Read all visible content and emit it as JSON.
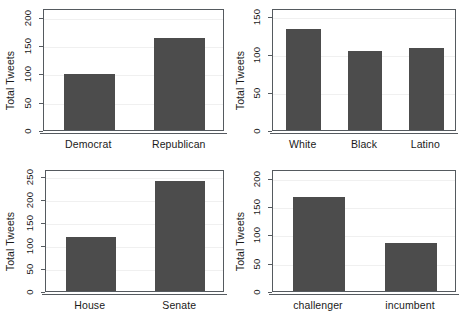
{
  "figure": {
    "background_color": "#ffffff",
    "bar_color": "#4c4c4c",
    "frame_color": "#555a5f",
    "grid_color": "#f0f0f0",
    "layout": "2x2 panel grid"
  },
  "chart_data": [
    {
      "type": "bar",
      "panel": "top-left",
      "title": "",
      "xlabel": "",
      "ylabel": "Total Tweets",
      "categories": [
        "Democrat",
        "Republican"
      ],
      "values": [
        99,
        163
      ],
      "yticks": [
        0,
        50,
        100,
        150,
        200
      ],
      "ytick_labels": [
        "0",
        "50",
        "100",
        "150",
        "200"
      ],
      "ylim": [
        0,
        215
      ],
      "grid": true,
      "legend": "none"
    },
    {
      "type": "bar",
      "panel": "top-right",
      "title": "",
      "xlabel": "",
      "ylabel": "Total Tweets",
      "categories": [
        "White",
        "Black",
        "Latino"
      ],
      "values": [
        132,
        104,
        107
      ],
      "yticks": [
        0,
        50,
        100,
        150
      ],
      "ytick_labels": [
        "0",
        "50",
        "100",
        "150"
      ],
      "ylim": [
        0,
        160
      ],
      "grid": true,
      "legend": "none"
    },
    {
      "type": "bar",
      "panel": "bottom-left",
      "title": "",
      "xlabel": "",
      "ylabel": "Total Tweets",
      "categories": [
        "House",
        "Senate"
      ],
      "values": [
        117,
        238
      ],
      "yticks": [
        0,
        50,
        100,
        150,
        200,
        250
      ],
      "ytick_labels": [
        "0",
        "50",
        "100",
        "150",
        "200",
        "250"
      ],
      "ylim": [
        0,
        265
      ],
      "grid": true,
      "legend": "none"
    },
    {
      "type": "bar",
      "panel": "bottom-right",
      "title": "",
      "xlabel": "",
      "ylabel": "Total Tweets",
      "categories": [
        "challenger",
        "incumbent"
      ],
      "values": [
        166,
        85
      ],
      "yticks": [
        0,
        50,
        100,
        150,
        200
      ],
      "ytick_labels": [
        "0",
        "50",
        "100",
        "150",
        "200"
      ],
      "ylim": [
        0,
        215
      ],
      "grid": true,
      "legend": "none"
    }
  ]
}
